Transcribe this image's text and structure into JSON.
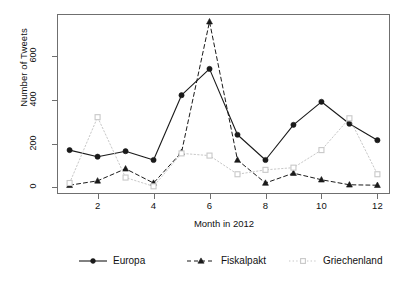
{
  "chart_data": {
    "type": "line",
    "title": "",
    "xlabel": "Month in 2012",
    "ylabel": "Number of Tweets",
    "x": [
      1,
      2,
      3,
      4,
      5,
      6,
      7,
      8,
      9,
      10,
      11,
      12
    ],
    "categories": [
      "1",
      "2",
      "3",
      "4",
      "5",
      "6",
      "7",
      "8",
      "9",
      "10",
      "11",
      "12"
    ],
    "xtick_labels": [
      "2",
      "4",
      "6",
      "8",
      "10",
      "12"
    ],
    "xtick_values": [
      2,
      4,
      6,
      8,
      10,
      12
    ],
    "ytick_labels": [
      "0",
      "200",
      "400",
      "600"
    ],
    "ytick_values": [
      0,
      200,
      400,
      600
    ],
    "xlim": [
      0.55,
      12.45
    ],
    "ylim": [
      -30,
      790
    ],
    "grid": false,
    "legend_position": "bottom",
    "series": [
      {
        "name": "Europa",
        "color": "#1a1a1a",
        "linestyle": "solid",
        "marker": "filled-circle",
        "values": [
          170,
          140,
          165,
          125,
          420,
          540,
          240,
          125,
          285,
          390,
          290,
          215
        ]
      },
      {
        "name": "Fiskalpakt",
        "color": "#1a1a1a",
        "linestyle": "dashed",
        "marker": "filled-triangle",
        "values": [
          10,
          30,
          85,
          20,
          160,
          755,
          125,
          20,
          65,
          35,
          12,
          10
        ]
      },
      {
        "name": "Griechenland",
        "color": "#c8c8c8",
        "linestyle": "dotted",
        "marker": "open-square",
        "values": [
          20,
          320,
          45,
          5,
          155,
          145,
          60,
          80,
          90,
          170,
          315,
          60
        ]
      }
    ]
  },
  "legend": {
    "items": [
      {
        "label": "Europa"
      },
      {
        "label": "Fiskalpakt"
      },
      {
        "label": "Griechenland"
      }
    ]
  },
  "axes": {
    "y_title": "Number of Tweets",
    "x_title": "Month in 2012"
  },
  "colors": {
    "axis": "#6f6f6f",
    "text": "#111111",
    "series_dark": "#1a1a1a",
    "series_light": "#c8c8c8",
    "background": "#ffffff"
  }
}
